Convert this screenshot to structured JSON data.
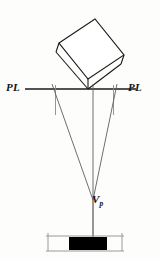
{
  "figure": {
    "background_color": "#fdfdfb",
    "line_color": "#1a1a1a",
    "thin_line_color": "#6e6e6e",
    "fill_color": "#000000",
    "width": 160,
    "height": 259
  },
  "labels": {
    "pl_left": "PL",
    "pl_right": "PL",
    "vanishing_point": "V",
    "vanishing_point_subscript": "p"
  },
  "geometry": {
    "picture_line": {
      "x1": 25,
      "y1": 89,
      "x2": 136,
      "y2": 89
    },
    "tilted_box": {
      "top_face": [
        [
          59,
          43
        ],
        [
          95,
          19
        ],
        [
          124,
          55
        ],
        [
          88,
          79
        ]
      ],
      "front_left_edge": [
        [
          59,
          43
        ],
        [
          56,
          52
        ]
      ],
      "front_right_edge": [
        [
          124,
          55
        ],
        [
          121,
          64
        ]
      ],
      "front_bottom_edge": [
        [
          56,
          52
        ],
        [
          88,
          89
        ]
      ],
      "front_bottom_right_edge": [
        [
          88,
          89
        ],
        [
          121,
          64
        ]
      ]
    },
    "ticks": [
      {
        "name": "left-tick",
        "x1": 55,
        "y1": 86,
        "x2": 55,
        "y2": 114
      },
      {
        "name": "right-tick",
        "x1": 113,
        "y1": 86,
        "x2": 113,
        "y2": 114
      }
    ],
    "projection_lines": [
      {
        "name": "left-projector",
        "x1": 53,
        "y1": 85,
        "x2": 93,
        "y2": 199
      },
      {
        "name": "center-projector",
        "x1": 93,
        "y1": 85,
        "x2": 93,
        "y2": 199
      },
      {
        "name": "right-projector",
        "x1": 116,
        "y1": 85,
        "x2": 93,
        "y2": 199
      }
    ],
    "vanishing_point": {
      "x": 93,
      "y": 199
    },
    "drop_line": {
      "x1": 93,
      "y1": 199,
      "x2": 93,
      "y2": 243
    },
    "container": {
      "x": 46,
      "y": 235,
      "width": 78,
      "height": 16,
      "side_wall_height": 16
    },
    "black_bar": {
      "x": 69,
      "y": 237,
      "width": 38,
      "height": 13
    }
  }
}
